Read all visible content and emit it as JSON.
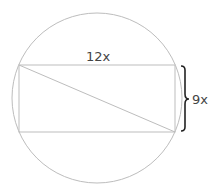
{
  "diagram": {
    "type": "geometry",
    "labels": {
      "width": "12x",
      "height": "9x"
    },
    "colors": {
      "shape_stroke": "#bdbdbd",
      "brace": "#222222",
      "text": "#444444"
    }
  }
}
